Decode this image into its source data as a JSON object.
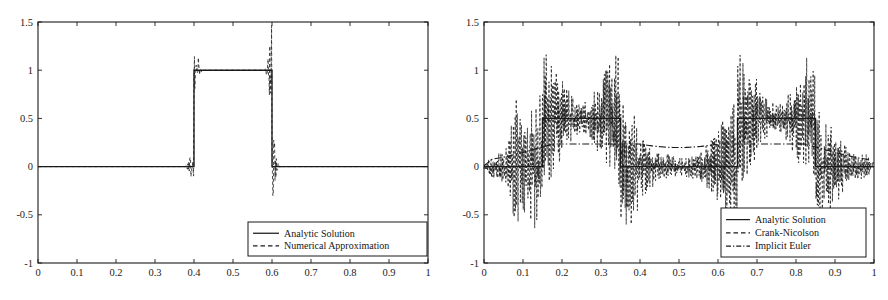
{
  "figure": {
    "title": "",
    "panel_count": 2,
    "background": "#ffffff",
    "line_color": "#1a1a1a"
  },
  "chart_data": [
    {
      "id": "left-panel",
      "type": "line",
      "title": "",
      "xlabel": "",
      "ylabel": "",
      "xlim": [
        0,
        1
      ],
      "ylim": [
        -1,
        1.5
      ],
      "grid": false,
      "xticks": [
        0,
        0.1,
        0.2,
        0.3,
        0.4,
        0.5,
        0.6,
        0.7,
        0.8,
        0.9,
        1
      ],
      "xticklabels": [
        "0",
        "0.1",
        "0.2",
        "0.3",
        "0.4",
        "0.5",
        "0.6",
        "0.7",
        "0.8",
        "0.9",
        "1"
      ],
      "yticks": [
        -1,
        -0.5,
        0,
        0.5,
        1,
        1.5
      ],
      "yticklabels": [
        "-1",
        "-0.5",
        "0",
        "0.5",
        "1",
        "1.5"
      ],
      "legend_position": "lower right",
      "series": [
        {
          "name": "Analytic Solution",
          "style": "solid",
          "description": "Square pulse of height 1 between x=0.4 and x=0.6, zero elsewhere",
          "x": [
            0,
            0.4,
            0.4,
            0.6,
            0.6,
            1
          ],
          "values": [
            0,
            0,
            1,
            1,
            0,
            0
          ]
        },
        {
          "name": "Numerical Approximation",
          "style": "dashed",
          "description": "Square pulse with Gibbs oscillations localized at the two discontinuities; overshoot to about 1.35 above and undershoot to about -0.38 below",
          "overshoot_max": 1.35,
          "undershoot_min": -0.38,
          "oscillation_regions": [
            [
              0.38,
              0.42
            ],
            [
              0.58,
              0.62
            ]
          ]
        }
      ]
    },
    {
      "id": "right-panel",
      "type": "line",
      "title": "",
      "xlabel": "",
      "ylabel": "",
      "xlim": [
        0,
        1
      ],
      "ylim": [
        -1,
        1.5
      ],
      "grid": false,
      "xticks": [
        0,
        0.1,
        0.2,
        0.3,
        0.4,
        0.5,
        0.6,
        0.7,
        0.8,
        0.9,
        1
      ],
      "xticklabels": [
        "0",
        "0.1",
        "0.2",
        "0.3",
        "0.4",
        "0.5",
        "0.6",
        "0.7",
        "0.8",
        "0.9",
        "1"
      ],
      "yticks": [
        -1,
        -0.5,
        0,
        0.5,
        1,
        1.5
      ],
      "yticklabels": [
        "-1",
        "-0.5",
        "0",
        "0.5",
        "1",
        "1.5"
      ],
      "legend_position": "lower right",
      "series": [
        {
          "name": "Analytic Solution",
          "style": "solid",
          "description": "Two square pulses of height 0.5: one between x=0.15 and x=0.35, another between x=0.65 and x=0.85",
          "x": [
            0,
            0.15,
            0.15,
            0.35,
            0.35,
            0.65,
            0.65,
            0.85,
            0.85,
            1
          ],
          "values": [
            0,
            0,
            0.5,
            0.5,
            0,
            0,
            0.5,
            0.5,
            0,
            0
          ]
        },
        {
          "name": "Crank-Nicolson",
          "style": "dashed",
          "description": "High-frequency spurious oscillations across the whole domain, largest near the pulse edges; peaks reach about 1.25 and troughs about -0.68",
          "overshoot_max": 1.25,
          "undershoot_min": -0.68
        },
        {
          "name": "Implicit Euler",
          "style": "dashdot",
          "description": "Heavily damped smooth profile, rising from 0 to a plateau near 0.22 over the pulse regions and dipping slightly to about 0.17 between them",
          "plateau_value": 0.22,
          "dip_value": 0.17
        }
      ]
    }
  ]
}
